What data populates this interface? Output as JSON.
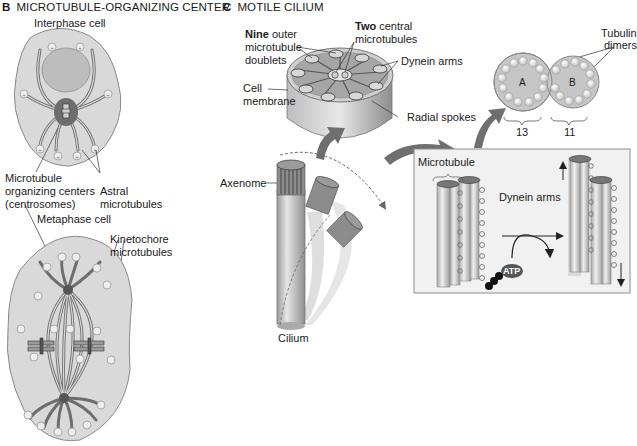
{
  "panel_b": {
    "letter": "B",
    "title": "MICROTUBULE-ORGANIZING CENTER",
    "interphase_label": "Interphase cell",
    "metaphase_label": "Metaphase cell",
    "mtoc_label_line1": "Microtubule",
    "mtoc_label_line2": "organizing centers",
    "mtoc_label_line3": "(centrosomes)",
    "astral_line1": "Astral",
    "astral_line2": "microtubules",
    "kinetochore_line1": "Kinetochore",
    "kinetochore_line2": "microtubules",
    "plus_symbol": "+"
  },
  "panel_c": {
    "letter": "C",
    "title": "MOTILE CILIUM",
    "nine_bold": "Nine",
    "nine_rest": " outer",
    "nine_line2": "microtubule",
    "nine_line3": "doublets",
    "two_bold": "Two",
    "two_rest": " central",
    "two_line2": "microtubules",
    "dynein_top": "Dynein arms",
    "cell_membrane_line1": "Cell",
    "cell_membrane_line2": "membrane",
    "radial_spokes": "Radial spokes",
    "tubulin_line1": "Tubulin",
    "tubulin_line2": "dimers",
    "tubule_a": "A",
    "tubule_b": "B",
    "count_a": "13",
    "count_b": "11",
    "axenome": "Axenome",
    "cilium": "Cilium",
    "microtubule": "Microtubule",
    "dynein_box": "Dynein arms",
    "atp": "ATP"
  },
  "colors": {
    "cell_fill": "#d9d9d9",
    "cell_stroke": "#8a8a8a",
    "nucleus": "#bdbdbd",
    "centrosome": "#6e6e6e",
    "microtubule": "#7a7a7a",
    "arrow": "#6f6f6f",
    "box_border": "#8c8c8c",
    "box_fill": "#f1f1f1"
  }
}
